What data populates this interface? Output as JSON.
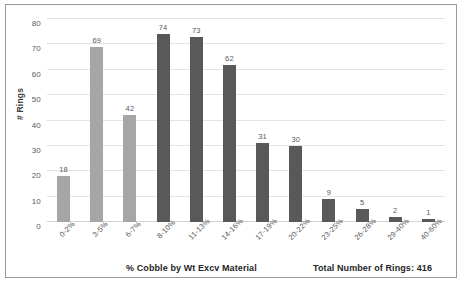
{
  "chart_data": {
    "type": "bar",
    "title": "",
    "subtitle": "",
    "xlabel": "% Cobble by Wt Excv Material",
    "ylabel": "# Rings",
    "categories": [
      "0-2%",
      "3-5%",
      "6-7%",
      "8-10%",
      "11-13%",
      "14-16%",
      "17-19%",
      "20-22%",
      "23-25%",
      "26-28%",
      "29-40%",
      "40-60%"
    ],
    "values": [
      18,
      69,
      42,
      74,
      73,
      62,
      31,
      30,
      9,
      5,
      2,
      1
    ],
    "bar_colors": [
      "#a6a6a6",
      "#a6a6a6",
      "#a6a6a6",
      "#595959",
      "#595959",
      "#595959",
      "#595959",
      "#595959",
      "#595959",
      "#595959",
      "#595959",
      "#595959"
    ],
    "data_labels": [
      "18",
      "69",
      "42",
      "74",
      "73",
      "62",
      "31",
      "30",
      "9",
      "5",
      "2",
      "1"
    ],
    "ylim": [
      0,
      80
    ],
    "yticks": [
      0,
      10,
      20,
      30,
      40,
      50,
      60,
      70,
      80
    ],
    "ytick_labels": [
      "0",
      "10",
      "20",
      "30",
      "40",
      "50",
      "60",
      "70",
      "80"
    ],
    "grid": true,
    "grid_axis": "y",
    "legend": false,
    "annotation": "Total Number of Rings: 416",
    "total_rings": 416,
    "xtick_rotation": -45
  },
  "figure": {
    "caption": ""
  },
  "colors": {
    "light_bar": "#a6a6a6",
    "dark_bar": "#595959",
    "gridline": "#e4e4e4",
    "frame_border": "#9a9a9a",
    "text": "#404040"
  }
}
